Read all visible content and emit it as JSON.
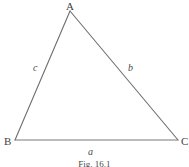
{
  "figure": {
    "caption": "Fig. 16.1",
    "stroke_color": "#6e6e6e",
    "background_color": "#ffffff",
    "text_color": "#3f3f3f"
  },
  "diagram": {
    "type": "triangle",
    "vertices": [
      {
        "id": "A",
        "label": "A",
        "x": 70,
        "y": 11
      },
      {
        "id": "B",
        "label": "B",
        "x": 15,
        "y": 140
      },
      {
        "id": "C",
        "label": "C",
        "x": 178,
        "y": 140
      }
    ],
    "sides": [
      {
        "id": "a",
        "label": "a",
        "between": "BC",
        "label_x": 88,
        "label_y": 147
      },
      {
        "id": "b",
        "label": "b",
        "between": "AC",
        "label_x": 128,
        "label_y": 63
      },
      {
        "id": "c",
        "label": "c",
        "between": "AB",
        "label_x": 33,
        "label_y": 63
      }
    ]
  }
}
